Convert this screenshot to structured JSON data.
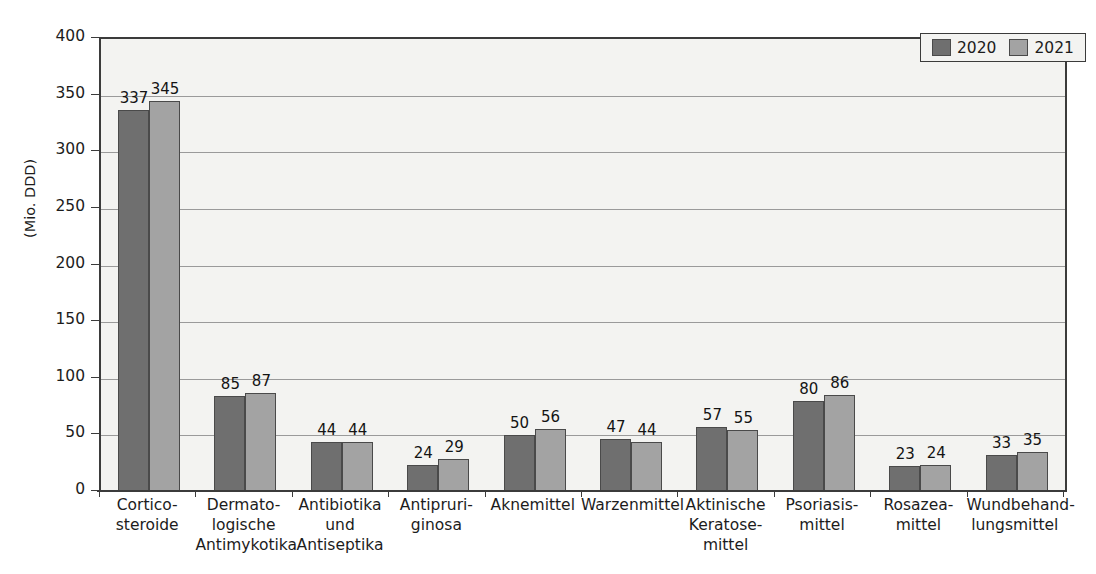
{
  "chart_data": {
    "type": "bar",
    "title": "",
    "subtitle": "",
    "xlabel": "",
    "ylabel": "(Mio. DDD)",
    "ylim": [
      0,
      400
    ],
    "ytick_step": 50,
    "yticks": [
      "0",
      "50",
      "100",
      "150",
      "200",
      "250",
      "300",
      "350",
      "400"
    ],
    "grid": true,
    "legend_position": "top-right",
    "categories": [
      "Cortico-\nsteroide",
      "Dermato-\nlogische\nAntimykotika",
      "Antibiotika\nund\nAntiseptika",
      "Antipruri-\nginosa",
      "Aknemittel",
      "Warzenmittel",
      "Aktinische\nKeratose-\nmittel",
      "Psoriasis-\nmittel",
      "Rosazea-\nmittel",
      "Wundbehand-\nlungsmittel"
    ],
    "series": [
      {
        "name": "2020",
        "color": "#6f6f6f",
        "values": [
          337,
          85,
          44,
          24,
          50,
          47,
          57,
          80,
          23,
          33
        ]
      },
      {
        "name": "2021",
        "color": "#a3a3a3",
        "values": [
          345,
          87,
          44,
          29,
          56,
          44,
          55,
          86,
          24,
          35
        ]
      }
    ]
  },
  "legend": {
    "entries": [
      {
        "label": "2020",
        "color": "#6f6f6f"
      },
      {
        "label": "2021",
        "color": "#a3a3a3"
      }
    ]
  },
  "axis": {
    "y_title": "(Mio. DDD)"
  }
}
